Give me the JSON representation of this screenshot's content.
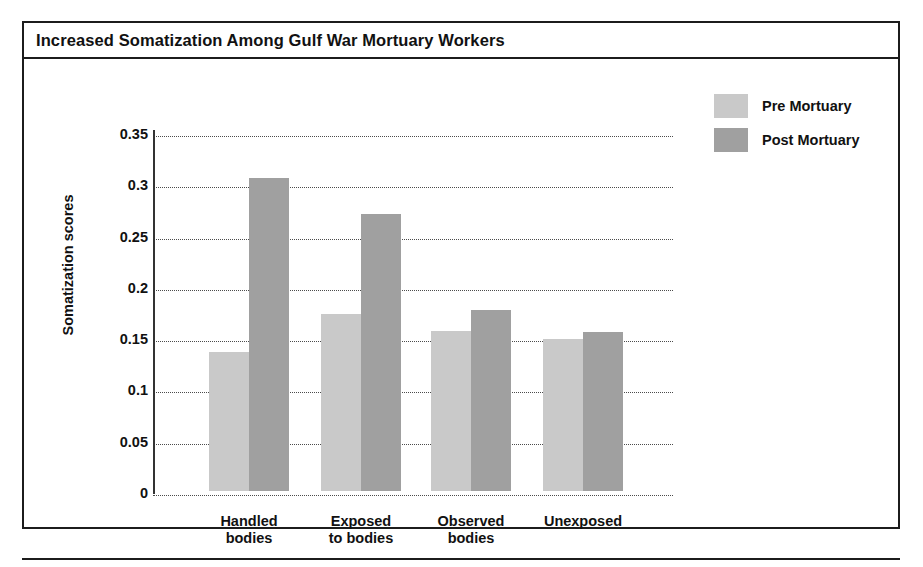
{
  "figure": {
    "title": "Increased Somatization Among Gulf War Mortuary Workers"
  },
  "legend": {
    "position": "top-right",
    "items": [
      {
        "label": "Pre Mortuary",
        "color": "#c9c9c9",
        "swatch": "legend-swatch-pre"
      },
      {
        "label": "Post Mortuary",
        "color": "#a0a0a0",
        "swatch": "legend-swatch-post"
      }
    ]
  },
  "axes": {
    "y_title": "Somatization scores",
    "y_ticks": [
      "0.35",
      "0.3",
      "0.25",
      "0.2",
      "0.15",
      "0.1",
      "0.05",
      "0"
    ],
    "x_categories_lines": [
      [
        "Handled",
        "bodies"
      ],
      [
        "Exposed",
        "to bodies"
      ],
      [
        "Observed",
        "bodies"
      ],
      [
        "Unexposed",
        ""
      ]
    ]
  },
  "chart_data": {
    "type": "bar",
    "title": "Increased Somatization Among Gulf War Mortuary Workers",
    "xlabel": "",
    "ylabel": "Somatization scores",
    "ylim": [
      0,
      0.35
    ],
    "ytick_step": 0.05,
    "grid": true,
    "grid_style": "dotted-horizontal",
    "legend_position": "top-right",
    "categories": [
      "Handled bodies",
      "Exposed to bodies",
      "Observed bodies",
      "Unexposed"
    ],
    "series": [
      {
        "name": "Pre Mortuary",
        "color": "#c9c9c9",
        "values": [
          0.136,
          0.173,
          0.156,
          0.148
        ]
      },
      {
        "name": "Post Mortuary",
        "color": "#a0a0a0",
        "values": [
          0.305,
          0.27,
          0.176,
          0.155
        ]
      }
    ]
  }
}
